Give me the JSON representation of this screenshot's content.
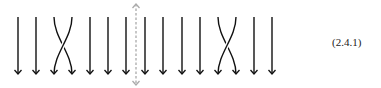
{
  "diagram": {
    "type": "braid",
    "strand_color": "#111111",
    "divider_color": "#aaaaaa",
    "strand_top_y": 17,
    "strand_bottom_y": 74,
    "strands_x": [
      18,
      36,
      54,
      72,
      90,
      108,
      126,
      145,
      163,
      182,
      200,
      218,
      236,
      254,
      272
    ],
    "crossings": [
      {
        "left_index": 2,
        "right_index": 3
      },
      {
        "left_index": 11,
        "right_index": 12
      }
    ],
    "divider": {
      "x": 136,
      "top_y": 4,
      "bottom_y": 85,
      "style": "dashed",
      "arrows": "both"
    }
  },
  "equation_label": "(2.4.1)"
}
